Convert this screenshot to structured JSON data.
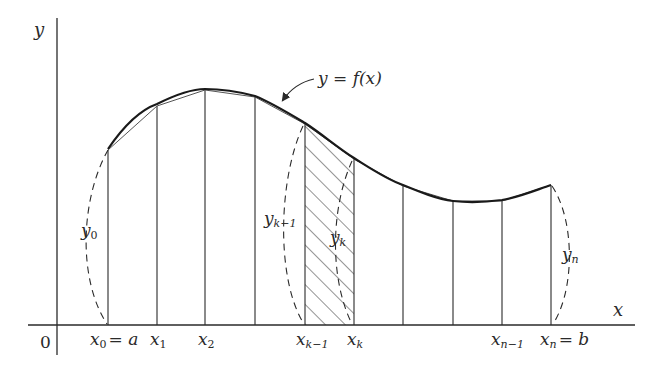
{
  "diagram": {
    "type": "riemann-trapezoid-area-under-curve",
    "curve_label": "y = f(x)",
    "axes": {
      "x_label": "x",
      "y_label": "y",
      "origin_label": "0"
    },
    "x_tick_labels": [
      {
        "id": "x0",
        "main": "x",
        "sub": "0",
        "suffix": "= a"
      },
      {
        "id": "x1",
        "main": "x",
        "sub": "1",
        "suffix": ""
      },
      {
        "id": "x2",
        "main": "x",
        "sub": "2",
        "suffix": ""
      },
      {
        "id": "xk-1",
        "main": "x",
        "sub": "k−1",
        "suffix": ""
      },
      {
        "id": "xk",
        "main": "x",
        "sub": "k",
        "suffix": ""
      },
      {
        "id": "xn-1",
        "main": "x",
        "sub": "n−1",
        "suffix": ""
      },
      {
        "id": "xn",
        "main": "x",
        "sub": "n",
        "suffix": "= b"
      }
    ],
    "ordinate_labels": [
      {
        "id": "y0",
        "main": "y",
        "sub": "0"
      },
      {
        "id": "yk-1",
        "main": "y",
        "sub": "k−1"
      },
      {
        "id": "yk",
        "main": "y",
        "sub": "k"
      },
      {
        "id": "yn",
        "main": "y",
        "sub": "n"
      }
    ],
    "ordinates_px": {
      "x": [
        108,
        157,
        205,
        255,
        305,
        354,
        403,
        453,
        502,
        551
      ],
      "top_y": [
        150,
        106,
        90,
        97,
        124,
        159,
        186,
        201,
        201,
        185
      ],
      "baseline_y": 325
    },
    "shaded_strip": {
      "from": "xk-1",
      "to": "xk",
      "pattern": "diagonal-hatch"
    },
    "colors": {
      "ink": "#2a2a2a",
      "background": "#ffffff"
    }
  }
}
